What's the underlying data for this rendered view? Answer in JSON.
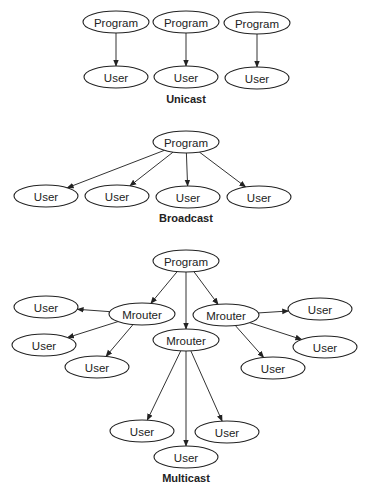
{
  "diagrams": {
    "unicast": {
      "caption": "Unicast",
      "nodes": [
        {
          "id": "p1",
          "label": "Program",
          "x": 116,
          "y": 22
        },
        {
          "id": "p2",
          "label": "Program",
          "x": 186,
          "y": 22
        },
        {
          "id": "p3",
          "label": "Program",
          "x": 257,
          "y": 23
        },
        {
          "id": "u1",
          "label": "User",
          "x": 116,
          "y": 77
        },
        {
          "id": "u2",
          "label": "User",
          "x": 186,
          "y": 77
        },
        {
          "id": "u3",
          "label": "User",
          "x": 257,
          "y": 78
        }
      ],
      "edges": [
        [
          "p1",
          "u1"
        ],
        [
          "p2",
          "u2"
        ],
        [
          "p3",
          "u3"
        ]
      ]
    },
    "broadcast": {
      "caption": "Broadcast",
      "nodes": [
        {
          "id": "p",
          "label": "Program",
          "x": 186,
          "y": 142
        },
        {
          "id": "u1",
          "label": "User",
          "x": 46,
          "y": 196
        },
        {
          "id": "u2",
          "label": "User",
          "x": 117,
          "y": 196
        },
        {
          "id": "u3",
          "label": "User",
          "x": 188,
          "y": 197
        },
        {
          "id": "u4",
          "label": "User",
          "x": 259,
          "y": 197
        }
      ],
      "edges": [
        [
          "p",
          "u1"
        ],
        [
          "p",
          "u2"
        ],
        [
          "p",
          "u3"
        ],
        [
          "p",
          "u4"
        ]
      ]
    },
    "multicast": {
      "caption": "Multicast",
      "nodes": [
        {
          "id": "p",
          "label": "Program",
          "x": 186,
          "y": 261
        },
        {
          "id": "mL",
          "label": "Mrouter",
          "x": 142,
          "y": 314
        },
        {
          "id": "mC",
          "label": "Mrouter",
          "x": 186,
          "y": 340
        },
        {
          "id": "mR",
          "label": "Mrouter",
          "x": 226,
          "y": 315
        },
        {
          "id": "uL1",
          "label": "User",
          "x": 46,
          "y": 307
        },
        {
          "id": "uL2",
          "label": "User",
          "x": 44,
          "y": 345
        },
        {
          "id": "uL3",
          "label": "User",
          "x": 97,
          "y": 367
        },
        {
          "id": "uR1",
          "label": "User",
          "x": 320,
          "y": 309
        },
        {
          "id": "uR2",
          "label": "User",
          "x": 325,
          "y": 347
        },
        {
          "id": "uR3",
          "label": "User",
          "x": 273,
          "y": 368
        },
        {
          "id": "uB1",
          "label": "User",
          "x": 142,
          "y": 431
        },
        {
          "id": "uB2",
          "label": "User",
          "x": 186,
          "y": 457
        },
        {
          "id": "uB3",
          "label": "User",
          "x": 227,
          "y": 432
        }
      ],
      "edges": [
        [
          "p",
          "mL"
        ],
        [
          "p",
          "mC"
        ],
        [
          "p",
          "mR"
        ],
        [
          "mL",
          "uL1"
        ],
        [
          "mL",
          "uL2"
        ],
        [
          "mL",
          "uL3"
        ],
        [
          "mR",
          "uR1"
        ],
        [
          "mR",
          "uR2"
        ],
        [
          "mR",
          "uR3"
        ],
        [
          "mC",
          "uB1"
        ],
        [
          "mC",
          "uB2"
        ],
        [
          "mC",
          "uB3"
        ]
      ]
    }
  },
  "captions": {
    "unicast": {
      "text": "Unicast",
      "x": 186,
      "y": 103
    },
    "broadcast": {
      "text": "Broadcast",
      "x": 186,
      "y": 222
    },
    "multicast": {
      "text": "Multicast",
      "x": 186,
      "y": 482
    }
  },
  "style": {
    "stroke": "#222222",
    "background": "#ffffff"
  }
}
